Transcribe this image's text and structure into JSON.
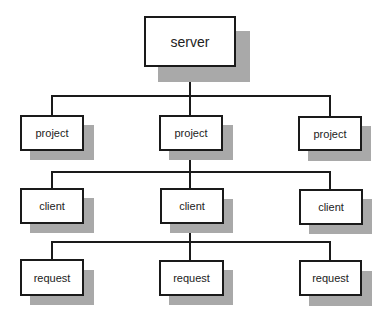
{
  "diagram": {
    "type": "tree",
    "root": {
      "label": "server"
    },
    "levels": [
      {
        "name": "project",
        "nodes": [
          {
            "label": "project"
          },
          {
            "label": "project"
          },
          {
            "label": "project"
          }
        ]
      },
      {
        "name": "client",
        "nodes": [
          {
            "label": "client"
          },
          {
            "label": "client"
          },
          {
            "label": "client"
          }
        ]
      },
      {
        "name": "request",
        "nodes": [
          {
            "label": "request"
          },
          {
            "label": "request"
          },
          {
            "label": "request"
          }
        ]
      }
    ],
    "edges": [
      [
        "server",
        "project[0]"
      ],
      [
        "server",
        "project[1]"
      ],
      [
        "server",
        "project[2]"
      ],
      [
        "project[1]",
        "client[0]"
      ],
      [
        "project[1]",
        "client[1]"
      ],
      [
        "project[1]",
        "client[2]"
      ],
      [
        "client[1]",
        "request[0]"
      ],
      [
        "client[1]",
        "request[1]"
      ],
      [
        "client[1]",
        "request[2]"
      ]
    ],
    "colors": {
      "line": "#1a1a1a",
      "shadow": "#a9a9a9",
      "box_fill": "#ffffff"
    }
  }
}
